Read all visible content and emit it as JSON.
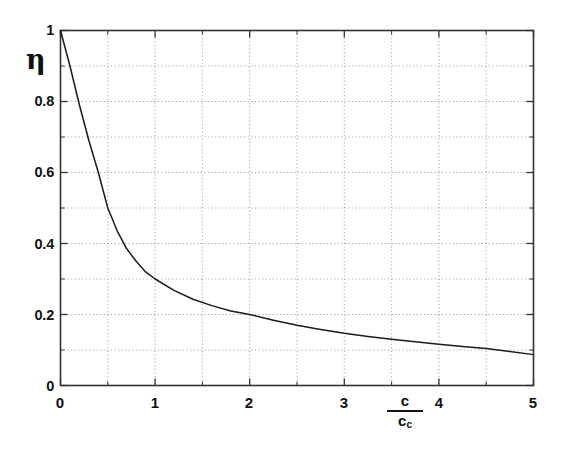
{
  "chart_data": {
    "type": "line",
    "title": "",
    "subtitle": "",
    "xlabel": "c/c_c",
    "xlabel_numerator": "c",
    "xlabel_denominator": "c",
    "xlabel_denominator_sub": "c",
    "ylabel": "η",
    "xlim": [
      0,
      5
    ],
    "ylim": [
      0,
      1
    ],
    "x_ticks": [
      0,
      1,
      2,
      3,
      4,
      5
    ],
    "x_tick_labels": [
      "0",
      "1",
      "2",
      "3",
      "4",
      "5"
    ],
    "x_minor_ticks": [
      0.5,
      1.5,
      2.5,
      3.5,
      4.5
    ],
    "y_ticks": [
      0,
      0.2,
      0.4,
      0.6,
      0.8,
      1
    ],
    "y_tick_labels": [
      "0",
      "0.2",
      "0.4",
      "0.6",
      "0.8",
      "1"
    ],
    "y_minor_ticks": [
      0.1,
      0.3,
      0.5,
      0.7,
      0.9
    ],
    "grid": true,
    "grid_style": "dotted",
    "legend": null,
    "series": [
      {
        "name": "eta",
        "color": "#1a1a1a",
        "x": [
          0,
          0.1,
          0.2,
          0.3,
          0.4,
          0.5,
          0.6,
          0.7,
          0.8,
          0.9,
          1,
          1.2,
          1.4,
          1.6,
          1.8,
          2,
          2.25,
          2.5,
          2.75,
          3,
          3.25,
          3.5,
          3.75,
          4,
          4.25,
          4.5,
          4.75,
          5
        ],
        "values": [
          1,
          0.9,
          0.79,
          0.69,
          0.6,
          0.5,
          0.435,
          0.385,
          0.35,
          0.32,
          0.3,
          0.268,
          0.243,
          0.225,
          0.21,
          0.2,
          0.184,
          0.17,
          0.158,
          0.147,
          0.138,
          0.13,
          0.123,
          0.116,
          0.11,
          0.104,
          0.096,
          0.087
        ]
      }
    ]
  },
  "axes": {
    "ylabel_text": "η",
    "frame_color": "#333333",
    "grid_color": "#8a8a8a",
    "curve_color": "#1a1a1a",
    "background": "#ffffff"
  }
}
